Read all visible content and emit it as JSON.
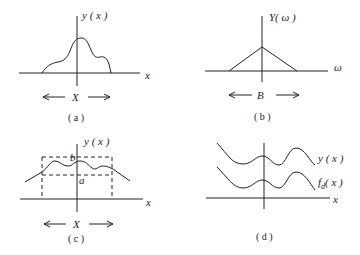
{
  "panels": {
    "a": {
      "caption": "( a )",
      "y_label": "y ( x )",
      "x_axis_label": "x",
      "span_label": "X",
      "description": "Single bump-shaped signal y(x) of finite extent X"
    },
    "b": {
      "caption": "( b )",
      "y_label": "Y( ω )",
      "x_axis_label": "ω",
      "span_label": "B",
      "description": "Triangular spectrum Y(ω) of bandwidth B"
    },
    "c": {
      "caption": "( c )",
      "y_label": "y ( x )",
      "x_axis_label": "x",
      "span_label": "X",
      "upper_bound_label": "b",
      "lower_bound_label": "a",
      "description": "Signal y(x) bounded between levels a and b over extent X (dashed box)"
    },
    "d": {
      "caption": "( d )",
      "curve1_label": "y ( x )",
      "curve2_label_main": "f",
      "curve2_label_sub": "d",
      "curve2_label_tail": "( x )",
      "x_axis_label": "x",
      "description": "Signal y(x) and its shifted counterpart f_d(x)"
    }
  },
  "colors": {
    "stroke": "#222222",
    "background": "#ffffff"
  }
}
